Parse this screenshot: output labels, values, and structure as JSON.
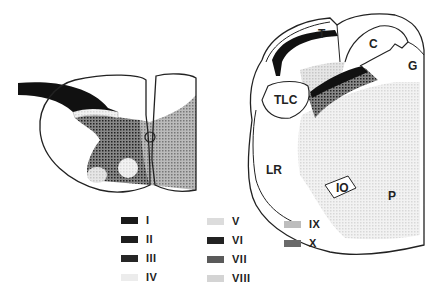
{
  "figure": {
    "left_panel": "spinal-cord-section",
    "right_panel": "medulla-section",
    "region_labels": {
      "T": "T",
      "C": "C",
      "G": "G",
      "TLC": "TLC",
      "LR": "LR",
      "IO": "IO",
      "P": "P"
    }
  },
  "legend": {
    "items": [
      {
        "label": "I",
        "color": "#1a1a1a"
      },
      {
        "label": "II",
        "color": "#1e1e1e"
      },
      {
        "label": "III",
        "color": "#262626"
      },
      {
        "label": "IV",
        "color": "#ececec"
      },
      {
        "label": "V",
        "color": "#dcdcdc"
      },
      {
        "label": "VI",
        "color": "#222222"
      },
      {
        "label": "VII",
        "color": "#5a5a5a"
      },
      {
        "label": "VIII",
        "color": "#d4d4d4"
      },
      {
        "label": "IX",
        "color": "#bdbdbd"
      },
      {
        "label": "X",
        "color": "#6a6a6a"
      }
    ]
  }
}
